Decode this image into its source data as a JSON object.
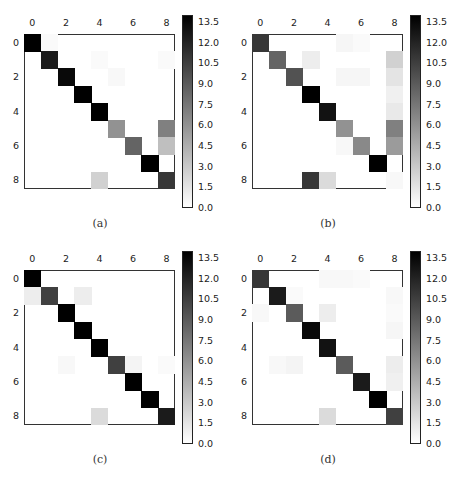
{
  "chart_data": [
    {
      "type": "heatmap",
      "title": "",
      "caption": "(a)",
      "x_ticks": [
        "0",
        "2",
        "4",
        "6",
        "8"
      ],
      "y_ticks": [
        "0",
        "2",
        "4",
        "6",
        "8"
      ],
      "n": 9,
      "colormap": "gray_r",
      "vmin": 0,
      "vmax": 14,
      "colorbar_ticks": [
        "0.0",
        "1.5",
        "3.0",
        "4.5",
        "6.0",
        "7.5",
        "9.0",
        "10.5",
        "12.0",
        "13.5"
      ],
      "matrix": [
        [
          14,
          0.3,
          0,
          0,
          0,
          0,
          0,
          0,
          0
        ],
        [
          0,
          12.5,
          0,
          0,
          0.3,
          0,
          0,
          0,
          0.3
        ],
        [
          0,
          0,
          13.5,
          0,
          0,
          0.4,
          0,
          0,
          0
        ],
        [
          0,
          0,
          0,
          14,
          0,
          0,
          0,
          0,
          0
        ],
        [
          0,
          0,
          0,
          0,
          14,
          0,
          0,
          0,
          0
        ],
        [
          0,
          0,
          0,
          0,
          0,
          6,
          0,
          0,
          7
        ],
        [
          0,
          0,
          0,
          0,
          0,
          0,
          8.5,
          0,
          3.5
        ],
        [
          0,
          0,
          0,
          0,
          0,
          0,
          0,
          14,
          0
        ],
        [
          0,
          0,
          0,
          0,
          2.5,
          0,
          0,
          0,
          11
        ]
      ]
    },
    {
      "type": "heatmap",
      "title": "",
      "caption": "(b)",
      "x_ticks": [
        "0",
        "2",
        "4",
        "6",
        "8"
      ],
      "y_ticks": [
        "0",
        "2",
        "4",
        "6",
        "8"
      ],
      "n": 9,
      "colormap": "gray_r",
      "vmin": 0,
      "vmax": 14,
      "colorbar_ticks": [
        "0.0",
        "1.5",
        "3.0",
        "4.5",
        "6.0",
        "7.5",
        "9.0",
        "10.5",
        "12.0",
        "13.5"
      ],
      "matrix": [
        [
          11,
          0,
          0,
          0,
          0,
          0.5,
          0.3,
          0,
          0
        ],
        [
          0,
          8.5,
          0,
          1,
          0,
          0,
          0,
          0,
          2.5
        ],
        [
          0,
          0,
          9.5,
          0,
          0,
          0.5,
          0.5,
          0,
          1.5
        ],
        [
          0,
          0,
          0,
          14,
          0,
          0,
          0,
          0,
          0.8
        ],
        [
          0,
          0,
          0,
          0,
          13,
          0,
          0,
          0,
          1.2
        ],
        [
          0,
          0,
          0,
          0,
          0,
          6,
          0,
          0,
          7
        ],
        [
          0,
          0,
          0,
          0,
          0,
          0.4,
          6.5,
          0,
          5.5
        ],
        [
          0,
          0,
          0,
          0,
          0,
          0,
          0,
          14,
          0
        ],
        [
          0,
          0,
          0,
          11,
          2,
          0,
          0,
          0,
          0.4
        ]
      ]
    },
    {
      "type": "heatmap",
      "title": "",
      "caption": "(c)",
      "x_ticks": [
        "0",
        "2",
        "4",
        "6",
        "8"
      ],
      "y_ticks": [
        "0",
        "2",
        "4",
        "6",
        "8"
      ],
      "n": 9,
      "colormap": "gray_r",
      "vmin": 0,
      "vmax": 14,
      "colorbar_ticks": [
        "0.0",
        "1.5",
        "3.0",
        "4.5",
        "6.0",
        "7.5",
        "9.0",
        "10.5",
        "12.0",
        "13.5"
      ],
      "matrix": [
        [
          14,
          0,
          0,
          0,
          0,
          0,
          0,
          0,
          0
        ],
        [
          1,
          10.5,
          0,
          1,
          0,
          0,
          0,
          0,
          0
        ],
        [
          0,
          0,
          14,
          0,
          0,
          0,
          0,
          0,
          0
        ],
        [
          0,
          0,
          0,
          14,
          0,
          0,
          0,
          0,
          0
        ],
        [
          0,
          0,
          0,
          0,
          14,
          0,
          0,
          0,
          0
        ],
        [
          0,
          0,
          0.4,
          0,
          0,
          10.5,
          0.6,
          0,
          0.3
        ],
        [
          0,
          0,
          0,
          0,
          0,
          0,
          14,
          0,
          0
        ],
        [
          0,
          0,
          0,
          0,
          0,
          0,
          0,
          14,
          0
        ],
        [
          0,
          0,
          0,
          0,
          2,
          0,
          0,
          0,
          12.5
        ]
      ]
    },
    {
      "type": "heatmap",
      "title": "",
      "caption": "(d)",
      "x_ticks": [
        "0",
        "2",
        "4",
        "6",
        "8"
      ],
      "y_ticks": [
        "0",
        "2",
        "4",
        "6",
        "8"
      ],
      "n": 9,
      "colormap": "gray_r",
      "vmin": 0,
      "vmax": 14,
      "colorbar_ticks": [
        "0.0",
        "1.5",
        "3.0",
        "4.5",
        "6.0",
        "7.5",
        "9.0",
        "10.5",
        "12.0",
        "13.5"
      ],
      "matrix": [
        [
          11,
          0,
          0,
          0,
          0.4,
          0.4,
          0.3,
          0,
          0
        ],
        [
          0,
          12.5,
          0.3,
          0,
          0,
          0,
          0,
          0,
          0.4
        ],
        [
          0.4,
          0,
          9,
          0,
          1,
          0,
          0,
          0,
          0.3
        ],
        [
          0,
          0,
          0,
          13.5,
          0,
          0,
          0,
          0,
          0.5
        ],
        [
          0,
          0,
          0,
          0,
          13,
          0,
          0,
          0,
          0
        ],
        [
          0,
          0.4,
          0.6,
          0,
          0,
          9,
          0,
          0,
          1
        ],
        [
          0,
          0,
          0,
          0,
          0,
          0,
          12.5,
          0,
          0.8
        ],
        [
          0,
          0,
          0,
          0,
          0,
          0,
          0,
          14,
          0
        ],
        [
          0,
          0,
          0,
          0,
          2,
          0,
          0,
          0,
          10.5
        ]
      ]
    }
  ]
}
